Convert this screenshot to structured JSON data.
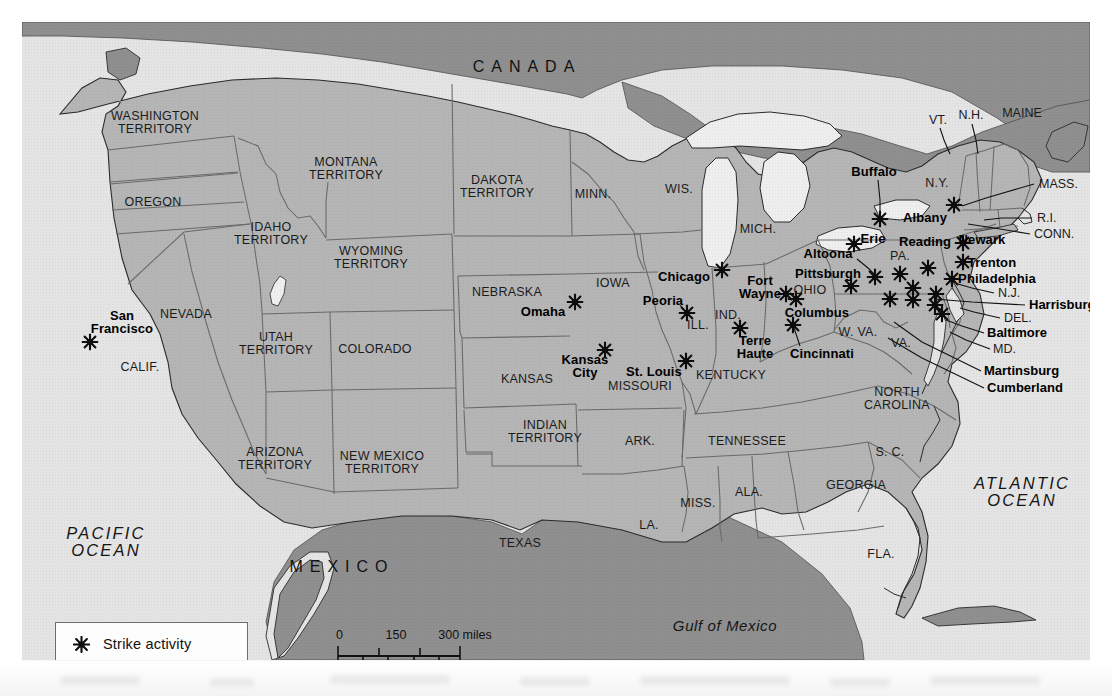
{
  "map": {
    "title": "Strike activity map of the United States",
    "colors": {
      "land_us": "#b4b4b4",
      "land_foreign": "#8e8e8e",
      "water": "#e6e6e6",
      "border": "#5a5a5a",
      "coast": "#2b2b2b",
      "marker": "#0d0d0d",
      "legend_bg": "#fdfdfd",
      "page_bg": "#ffffff"
    },
    "legend": {
      "marker_icon": "strike-activity-starburst-icon",
      "label": "Strike activity"
    },
    "scale": {
      "miles": {
        "ticks": [
          "0",
          "150",
          "300"
        ],
        "unit_label": "300 miles"
      },
      "kilometers": {
        "ticks": [
          "0",
          "150",
          "300"
        ],
        "unit_label": "300 kilometers"
      },
      "miles_row": [
        "0",
        "150",
        "300 miles"
      ],
      "km_row": [
        "0",
        "150",
        "300 kilometers"
      ]
    },
    "countries": [
      {
        "name": "CANADA",
        "x": 505,
        "y": 45,
        "cls": "country"
      },
      {
        "name": "MEXICO",
        "x": 320,
        "y": 545,
        "cls": "country"
      }
    ],
    "oceans": [
      {
        "name": "PACIFIC\nOCEAN",
        "x": 84,
        "y": 520,
        "cls": "ocean"
      },
      {
        "name": "ATLANTIC\nOCEAN",
        "x": 1000,
        "y": 470,
        "cls": "ocean"
      },
      {
        "name": "Gulf of Mexico",
        "x": 703,
        "y": 604,
        "cls": "water"
      }
    ],
    "states": [
      {
        "name": "WASHINGTON\nTERRITORY",
        "x": 133,
        "y": 101
      },
      {
        "name": "OREGON",
        "x": 131,
        "y": 180
      },
      {
        "name": "IDAHO\nTERRITORY",
        "x": 249,
        "y": 212
      },
      {
        "name": "MONTANA\nTERRITORY",
        "x": 324,
        "y": 147
      },
      {
        "name": "WYOMING\nTERRITORY",
        "x": 349,
        "y": 236
      },
      {
        "name": "DAKOTA\nTERRITORY",
        "x": 475,
        "y": 165
      },
      {
        "name": "NEBRASKA",
        "x": 485,
        "y": 270
      },
      {
        "name": "NEVADA",
        "x": 164,
        "y": 292
      },
      {
        "name": "CALIF.",
        "x": 118,
        "y": 345
      },
      {
        "name": "UTAH\nTERRITORY",
        "x": 254,
        "y": 322
      },
      {
        "name": "COLORADO",
        "x": 353,
        "y": 327
      },
      {
        "name": "ARIZONA\nTERRITORY",
        "x": 253,
        "y": 437
      },
      {
        "name": "NEW MEXICO\nTERRITORY",
        "x": 360,
        "y": 441
      },
      {
        "name": "KANSAS",
        "x": 505,
        "y": 357
      },
      {
        "name": "INDIAN\nTERRITORY",
        "x": 523,
        "y": 410
      },
      {
        "name": "TEXAS",
        "x": 498,
        "y": 521
      },
      {
        "name": "MINN.",
        "x": 571,
        "y": 172
      },
      {
        "name": "IOWA",
        "x": 591,
        "y": 261
      },
      {
        "name": "MISSOURI",
        "x": 618,
        "y": 364
      },
      {
        "name": "ARK.",
        "x": 618,
        "y": 419
      },
      {
        "name": "LA.",
        "x": 627,
        "y": 503
      },
      {
        "name": "WIS.",
        "x": 657,
        "y": 167
      },
      {
        "name": "ILL.",
        "x": 676,
        "y": 303
      },
      {
        "name": "MISS.",
        "x": 676,
        "y": 481
      },
      {
        "name": "IND.",
        "x": 706,
        "y": 293
      },
      {
        "name": "MICH.",
        "x": 736,
        "y": 207
      },
      {
        "name": "KENTUCKY",
        "x": 709,
        "y": 353
      },
      {
        "name": "TENNESSEE",
        "x": 725,
        "y": 419
      },
      {
        "name": "ALA.",
        "x": 727,
        "y": 470
      },
      {
        "name": "OHIO",
        "x": 788,
        "y": 268
      },
      {
        "name": "W. VA.",
        "x": 836,
        "y": 310
      },
      {
        "name": "VA.",
        "x": 879,
        "y": 321
      },
      {
        "name": "NORTH\nCAROLINA",
        "x": 875,
        "y": 377
      },
      {
        "name": "S. C.",
        "x": 868,
        "y": 430
      },
      {
        "name": "GEORGIA",
        "x": 834,
        "y": 463
      },
      {
        "name": "FLA.",
        "x": 859,
        "y": 532
      },
      {
        "name": "PA.",
        "x": 878,
        "y": 234
      },
      {
        "name": "N.Y.",
        "x": 915,
        "y": 161
      }
    ],
    "leader_labels": [
      {
        "name": "VT.",
        "x": 916,
        "y": 98,
        "bold": false
      },
      {
        "name": "N.H.",
        "x": 949,
        "y": 93,
        "bold": false
      },
      {
        "name": "MAINE",
        "x": 1000,
        "y": 91,
        "bold": false
      },
      {
        "name": "MASS.",
        "x": 1017,
        "y": 162,
        "bold": false,
        "align": "L"
      },
      {
        "name": "R.I.",
        "x": 1015,
        "y": 196,
        "bold": false,
        "align": "L"
      },
      {
        "name": "CONN.",
        "x": 1012,
        "y": 212,
        "bold": false,
        "align": "L"
      },
      {
        "name": "N.J.",
        "x": 976,
        "y": 271,
        "bold": false,
        "align": "L"
      },
      {
        "name": "DEL.",
        "x": 982,
        "y": 296,
        "bold": false,
        "align": "L"
      },
      {
        "name": "MD.",
        "x": 971,
        "y": 327,
        "bold": false,
        "align": "L"
      },
      {
        "name": "Harrisburg",
        "x": 1007,
        "y": 283,
        "bold": true,
        "align": "L"
      },
      {
        "name": "Baltimore",
        "x": 965,
        "y": 311,
        "bold": true,
        "align": "L"
      },
      {
        "name": "Martinsburg",
        "x": 962,
        "y": 349,
        "bold": true,
        "align": "L"
      },
      {
        "name": "Cumberland",
        "x": 965,
        "y": 366,
        "bold": true,
        "align": "L"
      }
    ],
    "cities": [
      {
        "name": "San Francisco",
        "label_x": 100,
        "label_y": 300,
        "label_align": "C",
        "mx": 68,
        "my": 320,
        "two_line": true
      },
      {
        "name": "Omaha",
        "label_x": 521,
        "label_y": 290,
        "label_align": "C",
        "mx": 553,
        "my": 280
      },
      {
        "name": "Kansas City",
        "label_x": 563,
        "label_y": 344,
        "label_align": "C",
        "mx": 583,
        "my": 328,
        "two_line": true
      },
      {
        "name": "St. Louis",
        "label_x": 632,
        "label_y": 350,
        "label_align": "C",
        "mx": 664,
        "my": 339
      },
      {
        "name": "Peoria",
        "label_x": 641,
        "label_y": 279,
        "label_align": "C",
        "mx": 665,
        "my": 291
      },
      {
        "name": "Chicago",
        "label_x": 662,
        "label_y": 255,
        "label_align": "C",
        "mx": 700,
        "my": 248
      },
      {
        "name": "Fort Wayne",
        "label_x": 738,
        "label_y": 265,
        "label_align": "C",
        "mx": 764,
        "my": 272,
        "two_line": true
      },
      {
        "name": "Terre Haute",
        "label_x": 733,
        "label_y": 325,
        "label_align": "C",
        "mx": 718,
        "my": 306,
        "two_line": true
      },
      {
        "name": "Cincinnati",
        "label_x": 800,
        "label_y": 332,
        "label_align": "C",
        "mx": 771,
        "my": 303
      },
      {
        "name": "Columbus",
        "label_x": 795,
        "label_y": 291,
        "label_align": "C",
        "mx": 774,
        "my": 277
      },
      {
        "name": "Pittsburgh",
        "label_x": 806,
        "label_y": 252,
        "label_align": "C",
        "mx": 829,
        "my": 264
      },
      {
        "name": "Altoona",
        "label_x": 806,
        "label_y": 232,
        "label_align": "C",
        "mx": 853,
        "my": 255
      },
      {
        "name": "Erie",
        "label_x": 851,
        "label_y": 217,
        "label_align": "C",
        "mx": 832,
        "my": 222
      },
      {
        "name": "Buffalo",
        "label_x": 852,
        "label_y": 150,
        "label_align": "C",
        "mx": 858,
        "my": 197
      },
      {
        "name": "Albany",
        "label_x": 903,
        "label_y": 196,
        "label_align": "C",
        "mx": 932,
        "my": 183
      },
      {
        "name": "Reading",
        "label_x": 903,
        "label_y": 220,
        "label_align": "C",
        "mx": 906,
        "my": 246
      },
      {
        "name": "Newark",
        "label_x": 960,
        "label_y": 218,
        "label_align": "C",
        "mx": 941,
        "my": 221
      },
      {
        "name": "Trenton",
        "label_x": 970,
        "label_y": 241,
        "label_align": "C",
        "mx": 941,
        "my": 240
      },
      {
        "name": "Philadelphia",
        "label_x": 975,
        "label_y": 257,
        "label_align": "C",
        "mx": 930,
        "my": 257
      }
    ],
    "strike_markers": [
      {
        "x": 68,
        "y": 320,
        "city": "San Francisco"
      },
      {
        "x": 553,
        "y": 280,
        "city": "Omaha"
      },
      {
        "x": 583,
        "y": 328,
        "city": "Kansas City"
      },
      {
        "x": 664,
        "y": 339,
        "city": "St. Louis"
      },
      {
        "x": 665,
        "y": 291,
        "city": "Peoria"
      },
      {
        "x": 700,
        "y": 248,
        "city": "Chicago"
      },
      {
        "x": 764,
        "y": 272,
        "city": "Fort Wayne"
      },
      {
        "x": 718,
        "y": 306,
        "city": "Terre Haute"
      },
      {
        "x": 771,
        "y": 303,
        "city": "Cincinnati"
      },
      {
        "x": 774,
        "y": 277,
        "city": "Columbus"
      },
      {
        "x": 829,
        "y": 264,
        "city": "Pittsburgh"
      },
      {
        "x": 853,
        "y": 255,
        "city": "Altoona"
      },
      {
        "x": 832,
        "y": 222,
        "city": "Erie"
      },
      {
        "x": 858,
        "y": 197,
        "city": "Buffalo"
      },
      {
        "x": 932,
        "y": 183,
        "city": "Albany"
      },
      {
        "x": 906,
        "y": 246,
        "city": "Reading"
      },
      {
        "x": 941,
        "y": 221,
        "city": "Newark"
      },
      {
        "x": 941,
        "y": 240,
        "city": "Trenton"
      },
      {
        "x": 930,
        "y": 257,
        "city": "Philadelphia"
      },
      {
        "x": 878,
        "y": 252,
        "city": ""
      },
      {
        "x": 891,
        "y": 266,
        "city": "Harrisburg"
      },
      {
        "x": 868,
        "y": 277,
        "city": ""
      },
      {
        "x": 891,
        "y": 278,
        "city": ""
      },
      {
        "x": 914,
        "y": 272,
        "city": ""
      },
      {
        "x": 913,
        "y": 283,
        "city": "Baltimore"
      },
      {
        "x": 920,
        "y": 292,
        "city": ""
      }
    ]
  }
}
